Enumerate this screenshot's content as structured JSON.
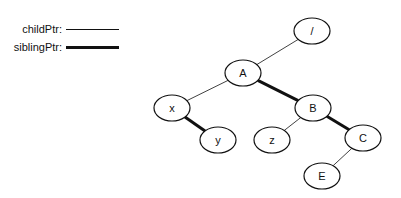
{
  "legend": {
    "items": [
      {
        "label": "childPtr:",
        "style": "thin"
      },
      {
        "label": "siblingPtr:",
        "style": "thick"
      }
    ]
  },
  "tree": {
    "nodes": [
      {
        "id": "root",
        "label": "/",
        "cx": 312,
        "cy": 31
      },
      {
        "id": "A",
        "label": "A",
        "cx": 243,
        "cy": 73
      },
      {
        "id": "x",
        "label": "x",
        "cx": 172,
        "cy": 108
      },
      {
        "id": "B",
        "label": "B",
        "cx": 313,
        "cy": 108
      },
      {
        "id": "y",
        "label": "y",
        "cx": 218,
        "cy": 140
      },
      {
        "id": "z",
        "label": "z",
        "cx": 272,
        "cy": 140
      },
      {
        "id": "C",
        "label": "C",
        "cx": 363,
        "cy": 138
      },
      {
        "id": "E",
        "label": "E",
        "cx": 322,
        "cy": 176
      }
    ],
    "edges": [
      {
        "from": "root",
        "to": "A",
        "type": "childPtr"
      },
      {
        "from": "A",
        "to": "x",
        "type": "childPtr"
      },
      {
        "from": "A",
        "to": "B",
        "type": "siblingPtr"
      },
      {
        "from": "x",
        "to": "y",
        "type": "siblingPtr"
      },
      {
        "from": "B",
        "to": "z",
        "type": "childPtr"
      },
      {
        "from": "B",
        "to": "C",
        "type": "siblingPtr"
      },
      {
        "from": "C",
        "to": "E",
        "type": "childPtr"
      }
    ]
  }
}
